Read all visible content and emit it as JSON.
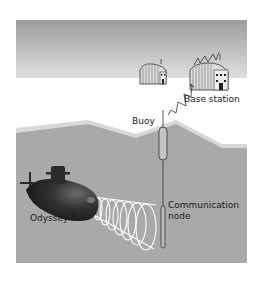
{
  "diagram": {
    "labels": {
      "base_station": "Base station",
      "buoy": "Buoy",
      "submarine": "Odyssey II",
      "communication_node_line1": "Communication",
      "communication_node_line2": "node"
    },
    "colors": {
      "sky_top": "#9a9a9a",
      "sky_bottom": "#dcdcdc",
      "water": "#a8a8a8",
      "water_surface": "#d6d6d6",
      "submarine": "#2b2b2b",
      "signal": "#ffffff"
    }
  }
}
